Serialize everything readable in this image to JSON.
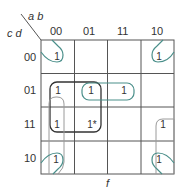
{
  "kmap": {
    "row_var_label": "c d",
    "col_var_label": "a b",
    "function_label": "f",
    "column_headers": [
      "00",
      "01",
      "11",
      "10"
    ],
    "row_headers": [
      "00",
      "01",
      "11",
      "10"
    ],
    "cells": [
      [
        "1",
        "",
        "",
        "1"
      ],
      [
        "1",
        "1",
        "1",
        ""
      ],
      [
        "1",
        "1*",
        "",
        "1"
      ],
      [
        "1",
        "",
        "",
        "1"
      ]
    ],
    "colors": {
      "grid": "#555555",
      "group_black": "#333333",
      "group_teal": "#4a8f8a",
      "group_gray": "#9a9a9a"
    }
  }
}
